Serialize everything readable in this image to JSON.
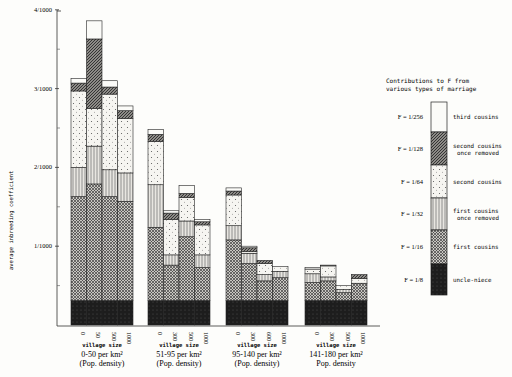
{
  "chart_data": {
    "type": "bar",
    "stacked": true,
    "title": "",
    "ylabel": "average inbreeding coefficient",
    "xlabel": "village size",
    "ylim": [
      0,
      4
    ],
    "y_unit": "per 1000",
    "y_ticks": [
      {
        "value": 1,
        "label": "1/1000"
      },
      {
        "value": 2,
        "label": "2/1000"
      },
      {
        "value": 3,
        "label": "3/1000"
      },
      {
        "value": 4,
        "label": "4/1000"
      }
    ],
    "y_minor_ticks": [
      0.5,
      1.5,
      2.5,
      3.5
    ],
    "segment_order": [
      "uncle-niece",
      "first cousins",
      "first cousins once removed",
      "second cousins",
      "second cousins once removed",
      "third cousins"
    ],
    "groups": [
      {
        "density_label": "0-50 per km²",
        "density_sub": "(Pop. density)",
        "xlabel": "village size",
        "bars": [
          {
            "village_size": "0",
            "segments": [
              0.31,
              1.32,
              0.37,
              0.97,
              0.1,
              0.06
            ]
          },
          {
            "village_size": "50",
            "segments": [
              0.31,
              1.48,
              0.48,
              0.48,
              0.88,
              0.23
            ]
          },
          {
            "village_size": "500",
            "segments": [
              0.31,
              1.32,
              0.34,
              0.96,
              0.09,
              0.08
            ]
          },
          {
            "village_size": "1000",
            "segments": [
              0.31,
              1.26,
              0.36,
              0.69,
              0.1,
              0.06
            ]
          }
        ]
      },
      {
        "density_label": "51-95 per km²",
        "density_sub": "(Pop. density)",
        "xlabel": "village size",
        "bars": [
          {
            "village_size": "0",
            "segments": [
              0.31,
              0.93,
              0.54,
              0.55,
              0.09,
              0.06
            ]
          },
          {
            "village_size": "300",
            "segments": [
              0.31,
              0.45,
              0.13,
              0.45,
              0.08,
              0.03
            ]
          },
          {
            "village_size": "500",
            "segments": [
              0.31,
              0.81,
              0.2,
              0.3,
              0.05,
              0.1
            ]
          },
          {
            "village_size": "1000",
            "segments": [
              0.31,
              0.42,
              0.16,
              0.38,
              0.04,
              0.03
            ]
          }
        ]
      },
      {
        "density_label": "95-140 per km²",
        "density_sub": "(Pop. density)",
        "xlabel": "village size",
        "bars": [
          {
            "village_size": "0",
            "segments": [
              0.31,
              0.77,
              0.18,
              0.39,
              0.05,
              0.04
            ]
          },
          {
            "village_size": "300",
            "segments": [
              0.31,
              0.47,
              0.13,
              0.02,
              0.05,
              0.02
            ]
          },
          {
            "village_size": "600",
            "segments": [
              0.31,
              0.25,
              0.08,
              0.14,
              0.04,
              0.0
            ]
          },
          {
            "village_size": "1000",
            "segments": [
              0.31,
              0.29,
              0.08,
              0.06,
              0.0,
              0.0
            ]
          }
        ]
      },
      {
        "density_label": "141-180 per km²",
        "density_sub": "Pop. density",
        "xlabel": "village size",
        "bars": [
          {
            "village_size": "0",
            "segments": [
              0.31,
              0.23,
              0.11,
              0.06,
              0.0,
              0.02
            ]
          },
          {
            "village_size": "300",
            "segments": [
              0.31,
              0.25,
              0.05,
              0.14,
              0.0,
              0.01
            ]
          },
          {
            "village_size": "500",
            "segments": [
              0.31,
              0.1,
              0.04,
              0.05,
              0.0,
              0.0
            ]
          },
          {
            "village_size": "1000",
            "segments": [
              0.31,
              0.22,
              0.0,
              0.06,
              0.05,
              0.0
            ]
          }
        ]
      }
    ],
    "legend": {
      "title_line1": "Contributions to F from",
      "title_line2": "various types of marriage",
      "position": "right",
      "entries": [
        {
          "f": "F = 1/256",
          "label1": "third cousins",
          "label2": "",
          "pattern": "blank"
        },
        {
          "f": "F = 1/128",
          "label1": "second cousins",
          "label2": "once removed",
          "pattern": "diagonal"
        },
        {
          "f": "F = 1/64",
          "label1": "second cousins",
          "label2": "",
          "pattern": "dots"
        },
        {
          "f": "F = 1/32",
          "label1": "first cousins",
          "label2": "once removed",
          "pattern": "vertical"
        },
        {
          "f": "F = 1/16",
          "label1": "first cousins",
          "label2": "",
          "pattern": "crosshatch"
        },
        {
          "f": "F = 1/8",
          "label1": "uncle-niece",
          "label2": "",
          "pattern": "dark"
        }
      ]
    },
    "grid": false
  }
}
